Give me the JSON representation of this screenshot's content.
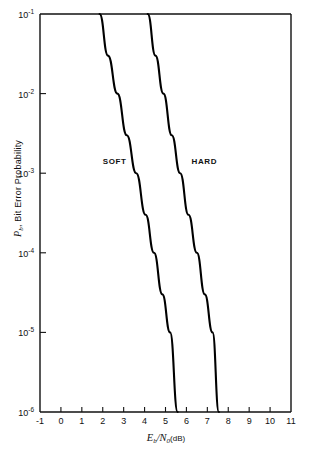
{
  "chart_data": {
    "type": "line",
    "title": "",
    "xlabel": "Eb/N0 (dB)",
    "ylabel": "Pb, Bit Error Probability",
    "xlim": [
      -1,
      11
    ],
    "ylim": [
      1e-06,
      0.1
    ],
    "yscale": "log",
    "grid": false,
    "legend_position": "inline-annotations",
    "x_ticks": [
      "-1",
      "0",
      "1",
      "2",
      "3",
      "4",
      "5",
      "6",
      "7",
      "8",
      "9",
      "10",
      "11"
    ],
    "x_tick_values": [
      -1,
      0,
      1,
      2,
      3,
      4,
      5,
      6,
      7,
      8,
      9,
      10,
      11
    ],
    "y_ticks": [
      "10-1",
      "10-2",
      "10-3",
      "10-4",
      "10-5",
      "10-6"
    ],
    "y_tick_values": [
      0.1,
      0.01,
      0.001,
      0.0001,
      1e-05,
      1e-06
    ],
    "series": [
      {
        "name": "SOFT",
        "label": "SOFT",
        "color": "#000000",
        "x": [
          1.85,
          2.25,
          2.7,
          3.15,
          3.6,
          4.05,
          4.45,
          4.85,
          5.22,
          5.58
        ],
        "y": [
          0.1,
          0.03,
          0.01,
          0.003,
          0.001,
          0.0003,
          0.0001,
          3e-05,
          1e-05,
          1e-06
        ],
        "annotation_x": 3.05,
        "annotation_y": 0.0014
      },
      {
        "name": "HARD",
        "label": "HARD",
        "color": "#000000",
        "x": [
          4.15,
          4.52,
          4.9,
          5.3,
          5.7,
          6.1,
          6.5,
          6.88,
          7.25,
          7.55
        ],
        "y": [
          0.1,
          0.03,
          0.01,
          0.003,
          0.001,
          0.0003,
          0.0001,
          3e-05,
          1e-05,
          1e-06
        ],
        "annotation_x": 7.3,
        "annotation_y": 0.0014
      }
    ]
  },
  "axis": {
    "y_title_prefix": "P",
    "y_title_sub": "b",
    "y_title_rest": ", Bit Error Probability",
    "x_title_e": "E",
    "x_title_e_sub": "b",
    "x_title_slash": "/",
    "x_title_n": "N",
    "x_title_n_sub": "0",
    "x_title_unit": "(dB)"
  },
  "ticks": {
    "x": [
      {
        "label": "-1",
        "value": -1
      },
      {
        "label": "0",
        "value": 0
      },
      {
        "label": "1",
        "value": 1
      },
      {
        "label": "2",
        "value": 2
      },
      {
        "label": "3",
        "value": 3
      },
      {
        "label": "4",
        "value": 4
      },
      {
        "label": "5",
        "value": 5
      },
      {
        "label": "6",
        "value": 6
      },
      {
        "label": "7",
        "value": 7
      },
      {
        "label": "8",
        "value": 8
      },
      {
        "label": "9",
        "value": 9
      },
      {
        "label": "10",
        "value": 10
      },
      {
        "label": "11",
        "value": 11
      }
    ],
    "y": [
      {
        "mantissa": "10",
        "exponent": "-1",
        "value": 0.1
      },
      {
        "mantissa": "10",
        "exponent": "-2",
        "value": 0.01
      },
      {
        "mantissa": "10",
        "exponent": "-3",
        "value": 0.001
      },
      {
        "mantissa": "10",
        "exponent": "-4",
        "value": 0.0001
      },
      {
        "mantissa": "10",
        "exponent": "-5",
        "value": 1e-05
      },
      {
        "mantissa": "10",
        "exponent": "-6",
        "value": 1e-06
      }
    ]
  },
  "colors": {
    "axis": "#111111",
    "curve": "#000000",
    "background": "#ffffff"
  }
}
